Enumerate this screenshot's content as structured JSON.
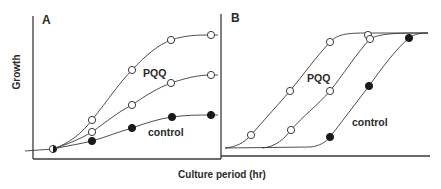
{
  "figure": {
    "xlabel": "Culture period (hr)",
    "ylabel": "Growth",
    "colors": {
      "ink": "#2a2a2a",
      "background": "#ffffff"
    }
  },
  "chart_data": [
    {
      "type": "line",
      "panel_label": "A",
      "title": "",
      "xlabel": "Culture period (hr)",
      "ylabel": "Growth",
      "grid": false,
      "axis_ticks": "none",
      "annotations": [
        {
          "text": "PQQ",
          "x": 143,
          "y": 77
        },
        {
          "text": "control",
          "x": 148,
          "y": 136
        }
      ],
      "series": [
        {
          "name": "PQQ (high)",
          "marker": "open-circle",
          "points_px": [
            [
              53,
              149
            ],
            [
              92,
              120
            ],
            [
              132,
              70
            ],
            [
              171,
              40
            ],
            [
              211,
              35
            ]
          ],
          "path": "M25,151 L53,149 C70,143 82,133 92,120 C108,100 120,82 132,70 C146,55 158,45 171,40 C186,35 198,35 211,35 L218,35"
        },
        {
          "name": "PQQ (low)",
          "marker": "open-circle",
          "points_px": [
            [
              53,
              149
            ],
            [
              92,
              132
            ],
            [
              132,
              105
            ],
            [
              171,
              83
            ],
            [
              211,
              75
            ]
          ],
          "path": "M53,149 C68,144 80,139 92,132 C106,122 118,112 132,105 C146,95 158,88 171,83 C186,78 198,75 211,75 L218,75"
        },
        {
          "name": "control",
          "marker": "filled-circle",
          "points_px": [
            [
              53,
              149
            ],
            [
              92,
              141
            ],
            [
              132,
              128
            ],
            [
              172,
              117
            ],
            [
              211,
              115
            ]
          ],
          "path": "M53,149 C66,146 80,144 92,141 C106,137 118,132 132,128 C146,123 158,119 172,117 C186,115 198,115 211,115 L218,115"
        }
      ]
    },
    {
      "type": "line",
      "panel_label": "B",
      "title": "",
      "xlabel": "Culture period (hr)",
      "ylabel": "Growth",
      "grid": false,
      "axis_ticks": "none",
      "annotations": [
        {
          "text": "PQQ",
          "x": 307,
          "y": 82
        },
        {
          "text": "control",
          "x": 352,
          "y": 126
        }
      ],
      "series": [
        {
          "name": "PQQ (high)",
          "marker": "open-circle",
          "points_px": [
            [
              251,
              135
            ],
            [
              290,
              91
            ],
            [
              330,
              42
            ],
            [
              368,
              35
            ]
          ],
          "path": "M225,148 C236,147 244,143 251,135 C264,120 277,106 290,91 C303,75 316,57 330,42 C338,34 346,33 368,33 L428,33"
        },
        {
          "name": "PQQ (low)",
          "marker": "open-circle",
          "points_px": [
            [
              291,
              130
            ],
            [
              330,
              91
            ],
            [
              370,
              39
            ]
          ],
          "path": "M262,148 C276,147 285,138 291,130 C304,115 317,106 330,91 C343,75 356,54 370,39 C380,33 400,33 428,33"
        },
        {
          "name": "control",
          "marker": "filled-circle",
          "points_px": [
            [
              330,
              137
            ],
            [
              369,
              86
            ],
            [
              409,
              38
            ]
          ],
          "path": "M225,148 L310,147 C320,146 326,142 330,137 C343,120 356,103 369,86 C382,68 395,50 409,38 C415,34 420,33 428,33"
        }
      ]
    }
  ]
}
